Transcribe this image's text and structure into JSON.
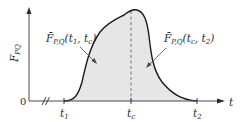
{
  "figure": {
    "type": "diagram",
    "colors": {
      "axis": "#4a4a4a",
      "curve": "#1a1a1a",
      "fill": "#e6e6e6",
      "dashed_line": "#6a6a6a",
      "text": "#2a2a2a"
    },
    "y_axis": {
      "label_main": "F",
      "label_sub": "PQ"
    },
    "x_axis": {
      "label": "t",
      "origin_label": "0",
      "break_mark": "//",
      "ticks": [
        {
          "main": "t",
          "sub": "1"
        },
        {
          "main": "t",
          "sub": "c"
        },
        {
          "main": "t",
          "sub": "2"
        }
      ]
    },
    "annotations": [
      {
        "bar": "F̄",
        "sub": "P,Q",
        "args_open": "(t",
        "a1": "1",
        "sep": ", t",
        "a2": "c",
        "close": ")"
      },
      {
        "bar": "F̄",
        "sub": "P,Q",
        "args_open": "(t",
        "a1": "c",
        "sep": ", t",
        "a2": "2",
        "close": ")"
      }
    ]
  }
}
